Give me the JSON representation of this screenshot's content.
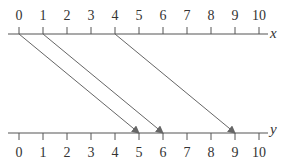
{
  "diagram": {
    "type": "mapping-diagram",
    "top_axis": {
      "variable": "x",
      "ticks": [
        "0",
        "1",
        "2",
        "3",
        "4",
        "5",
        "6",
        "7",
        "8",
        "9",
        "10"
      ]
    },
    "bottom_axis": {
      "variable": "y",
      "ticks": [
        "0",
        "1",
        "2",
        "3",
        "4",
        "5",
        "6",
        "7",
        "8",
        "9",
        "10"
      ]
    },
    "arrows": [
      {
        "from": 0,
        "to": 5
      },
      {
        "from": 1,
        "to": 6
      },
      {
        "from": 4,
        "to": 9
      }
    ],
    "colors": {
      "axis": "#555555",
      "arrow": "#666666",
      "text": "#333333"
    }
  }
}
